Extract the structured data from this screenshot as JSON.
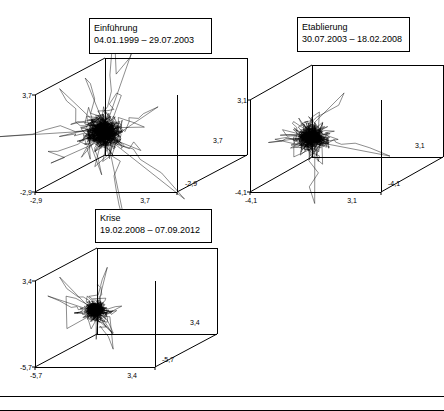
{
  "figure": {
    "width": 444,
    "height": 411,
    "background": "#ffffff",
    "line_color": "#000000",
    "panel_count": 3
  },
  "chart_data": {
    "type": "scatter",
    "subtype": "3d-phase-space-trajectory",
    "title": "",
    "panels": [
      {
        "id": "panel-einfuehrung",
        "title": "Einführung",
        "subtitle": "04.01.1999 – 29.07.2003",
        "axes": {
          "x": {
            "label": "",
            "ticks": [
              "-2,9",
              "3,7"
            ],
            "min": -2.9,
            "max": 3.7
          },
          "y": {
            "label": "",
            "ticks": [
              "-2,9",
              "3,7"
            ],
            "min": -2.9,
            "max": 3.7
          },
          "z": {
            "label": "",
            "ticks": [
              "-2,9",
              "3,7"
            ],
            "min": -2.9,
            "max": 3.7
          }
        },
        "tick_labels": {
          "left_top": "3,7",
          "left_bottom": "-2,9",
          "bottom_left": "-2,9",
          "bottom_right": "3,7",
          "depth_near": "-2,9",
          "right_axis": "3,7"
        },
        "n_points": 1150,
        "attractor_center": [
          0.25,
          0.2,
          0.15
        ],
        "attractor_spread": 1.0,
        "seed": 17
      },
      {
        "id": "panel-etablierung",
        "title": "Etablierung",
        "subtitle": "30.07.2003 – 18.02.2008",
        "axes": {
          "x": {
            "label": "",
            "ticks": [
              "-4,1",
              "3,1"
            ],
            "min": -4.1,
            "max": 3.1
          },
          "y": {
            "label": "",
            "ticks": [
              "-4,1",
              "3,1"
            ],
            "min": -4.1,
            "max": 3.1
          },
          "z": {
            "label": "",
            "ticks": [
              "-4,1",
              "3,1"
            ],
            "min": -4.1,
            "max": 3.1
          }
        },
        "tick_labels": {
          "left_top": "3,1",
          "left_bottom": "-4,1",
          "bottom_left": "-4,1",
          "bottom_right": "3,1",
          "depth_near": "-4,1",
          "right_axis": "3,1"
        },
        "n_points": 1150,
        "attractor_center": [
          0.1,
          0.1,
          0.1
        ],
        "attractor_spread": 0.82,
        "seed": 53
      },
      {
        "id": "panel-krise",
        "title": "Krise",
        "subtitle": "19.02.2008 – 07.09.2012",
        "axes": {
          "x": {
            "label": "",
            "ticks": [
              "-5,7",
              "3,4"
            ],
            "min": -5.7,
            "max": 3.4
          },
          "y": {
            "label": "",
            "ticks": [
              "-5,7",
              "3,4"
            ],
            "min": -5.7,
            "max": 3.4
          },
          "z": {
            "label": "",
            "ticks": [
              "-5,7",
              "3,4"
            ],
            "min": -5.7,
            "max": 3.4
          }
        },
        "tick_labels": {
          "left_top": "3,4",
          "left_bottom": "-5,7",
          "bottom_left": "-5,7",
          "bottom_right": "3,4",
          "depth_near": "-5,7",
          "right_axis": "3,4"
        },
        "n_points": 1150,
        "attractor_center": [
          -0.05,
          0.0,
          0.05
        ],
        "attractor_spread": 0.72,
        "seed": 91
      }
    ],
    "xlabel": "",
    "ylabel": "",
    "grid": false,
    "legend": null
  }
}
